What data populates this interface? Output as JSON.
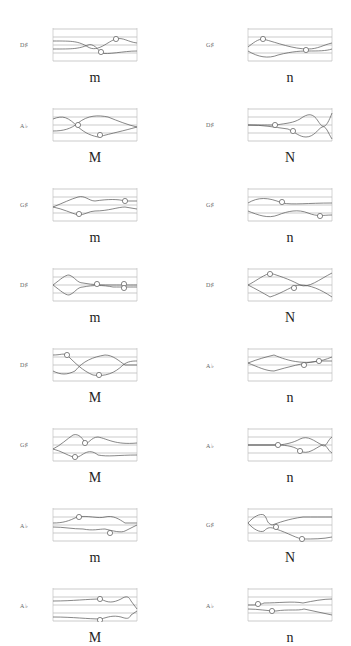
{
  "figure": {
    "columns": 2,
    "rows": 8,
    "panels": [
      {
        "id": "r1c1",
        "note": "D♯",
        "letter": "m",
        "col": 0,
        "row": 0
      },
      {
        "id": "r1c2",
        "note": "G♯",
        "letter": "n",
        "col": 1,
        "row": 0
      },
      {
        "id": "r2c1",
        "note": "A♭",
        "letter": "M",
        "col": 0,
        "row": 1
      },
      {
        "id": "r2c2",
        "note": "D♯",
        "letter": "N",
        "col": 1,
        "row": 1
      },
      {
        "id": "r3c1",
        "note": "G♯",
        "letter": "m",
        "col": 0,
        "row": 2
      },
      {
        "id": "r3c2",
        "note": "G♯",
        "letter": "n",
        "col": 1,
        "row": 2
      },
      {
        "id": "r4c1",
        "note": "D♯",
        "letter": "m",
        "col": 0,
        "row": 3
      },
      {
        "id": "r4c2",
        "note": "D♯",
        "letter": "N",
        "col": 1,
        "row": 3
      },
      {
        "id": "r5c1",
        "note": "D♯",
        "letter": "M",
        "col": 0,
        "row": 4
      },
      {
        "id": "r5c2",
        "note": "A♭",
        "letter": "n",
        "col": 1,
        "row": 4
      },
      {
        "id": "r6c1",
        "note": "G♯",
        "letter": "M",
        "col": 0,
        "row": 5
      },
      {
        "id": "r6c2",
        "note": "A♭",
        "letter": "n",
        "col": 1,
        "row": 5
      },
      {
        "id": "r7c1",
        "note": "A♭",
        "letter": "m",
        "col": 0,
        "row": 6
      },
      {
        "id": "r7c2",
        "note": "G♯",
        "letter": "N",
        "col": 1,
        "row": 6
      },
      {
        "id": "r8c1",
        "note": "A♭",
        "letter": "M",
        "col": 0,
        "row": 7
      },
      {
        "id": "r8c2",
        "note": "A♭",
        "letter": "n",
        "col": 1,
        "row": 7
      }
    ]
  },
  "traces": {
    "r1c1": {
      "paths": [
        "M0,12 C20,12 25,12 35,18 C45,24 55,12 63,10 C70,8 75,13 84,14",
        "M0,20 C20,20 25,20 35,16 C40,14 45,20 48,24 C55,26 70,22 84,22"
      ],
      "circles": [
        [
          63,
          10
        ],
        [
          48,
          23
        ]
      ]
    },
    "r1c2": {
      "paths": [
        "M0,18 C5,14 10,10 15,10 C30,14 45,20 60,20 C70,20 75,16 84,14",
        "M0,22 C10,28 20,30 30,26 C45,22 55,22 60,22 C70,22 78,22 84,20"
      ],
      "circles": [
        [
          15,
          10
        ],
        [
          58,
          21
        ]
      ]
    },
    "r2c1": {
      "paths": [
        "M0,10 C10,6 15,8 25,18 C30,22 35,26 45,28 C60,24 70,22 84,18",
        "M0,22 C10,22 18,20 25,14 C35,6 45,6 55,8 C65,12 75,16 84,18"
      ],
      "circles": [
        [
          25,
          16
        ],
        [
          47,
          26
        ]
      ]
    },
    "r2c2": {
      "paths": [
        "M0,16 C15,16 20,16 28,16 C40,14 45,14 52,10 C60,4 65,4 70,12 C75,20 78,20 84,4",
        "M0,16 C15,16 25,18 40,20 C48,24 52,28 58,28 C66,28 70,20 74,18 C78,16 80,24 84,30"
      ],
      "circles": [
        [
          27,
          16
        ],
        [
          45,
          22
        ]
      ]
    },
    "r3c1": {
      "paths": [
        "M0,18 C10,14 18,10 25,8 C32,6 36,12 42,12 C55,10 65,10 72,12 L84,12",
        "M0,18 C10,20 18,24 25,26 C32,26 36,22 42,22 C55,22 65,18 72,18 L84,20"
      ],
      "circles": [
        [
          72,
          12
        ],
        [
          26,
          25
        ]
      ]
    },
    "r3c2": {
      "paths": [
        "M0,14 C10,8 20,8 34,14 C45,16 60,14 84,14",
        "M0,22 C10,26 20,30 30,26 C40,22 50,20 60,24 C70,28 75,26 84,26"
      ],
      "circles": [
        [
          34,
          13
        ],
        [
          72,
          27
        ]
      ]
    },
    "r4c1": {
      "paths": [
        "M0,16 C8,10 12,6 16,6 C22,8 24,14 30,14 C40,16 50,16 60,16 C70,16 75,16 84,16",
        "M0,16 C8,22 12,26 16,26 C22,24 24,18 30,18 C40,16 50,16 60,18 C70,18 75,18 84,18"
      ],
      "circles": [
        [
          44,
          15
        ],
        [
          71,
          15
        ],
        [
          71,
          19
        ]
      ]
    },
    "r4c2": {
      "paths": [
        "M0,16 C8,12 12,8 22,4 C35,8 45,12 52,16 C60,20 72,10 84,4",
        "M0,16 C8,20 15,24 22,28 C35,24 45,16 52,16 C62,16 72,20 84,28"
      ],
      "circles": [
        [
          22,
          5
        ],
        [
          46,
          19
        ]
      ]
    },
    "r5c1": {
      "paths": [
        "M0,6 C8,6 10,4 14,6 C22,14 30,22 40,26 C52,28 62,24 70,16 C75,12 80,12 84,12",
        "M0,22 C8,26 14,26 22,22 C30,12 40,8 52,6 C60,6 66,12 72,16 L84,16"
      ],
      "circles": [
        [
          14,
          6
        ],
        [
          46,
          26
        ]
      ]
    },
    "r5c2": {
      "paths": [
        "M0,14 C10,10 18,8 26,6 C40,12 60,18 84,8",
        "M0,14 C10,18 18,22 26,22 C40,18 55,14 70,12 L84,12"
      ],
      "circles": [
        [
          56,
          16
        ],
        [
          71,
          12
        ]
      ]
    },
    "r6c1": {
      "paths": [
        "M0,20 C8,16 14,10 20,6 C26,4 30,10 32,14 C35,16 38,8 45,8 C55,10 62,16 84,14",
        "M0,20 C8,22 14,26 20,28 C24,30 28,26 32,24 C36,22 40,22 45,26 C55,28 65,26 84,26"
      ],
      "circles": [
        [
          32,
          14
        ],
        [
          22,
          28
        ]
      ]
    },
    "r6c2": {
      "paths": [
        "M0,16 L28,16 C35,16 45,14 52,10 C60,6 66,12 74,16 C78,20 80,10 84,8",
        "M0,16 L28,16 C40,16 48,18 52,22 C60,26 66,20 74,16 C78,14 80,22 84,24"
      ],
      "circles": [
        [
          30,
          16
        ],
        [
          52,
          22
        ]
      ]
    },
    "r7c1": {
      "paths": [
        "M0,14 C10,14 16,12 24,8 C35,6 45,10 52,8 C60,6 66,10 72,14 L84,14",
        "M0,18 C10,18 20,20 30,20 C40,22 46,20 52,20 C60,22 68,24 72,22 L84,16"
      ],
      "circles": [
        [
          26,
          8
        ],
        [
          57,
          24
        ]
      ]
    },
    "r7c2": {
      "paths": [
        "M0,14 C5,8 12,4 16,6 C20,10 18,14 24,16 C30,14 40,10 55,8 C65,8 75,8 84,8",
        "M0,14 C5,20 12,24 16,22 C20,18 22,18 28,20 C40,24 50,30 55,30 C65,30 75,30 84,28"
      ],
      "circles": [
        [
          28,
          18
        ],
        [
          54,
          30
        ]
      ]
    },
    "r8c1": {
      "paths": [
        "M0,12 C20,12 35,10 48,10 C55,14 60,14 68,10 C74,6 76,8 78,12 L84,20",
        "M0,28 C20,28 35,30 48,30 C55,28 60,26 68,28 C74,30 76,30 78,26 L84,22"
      ],
      "circles": [
        [
          47,
          10
        ],
        [
          47,
          31
        ]
      ]
    },
    "r8c2": {
      "paths": [
        "M0,16 C8,16 12,16 16,14 C30,14 45,12 55,14 C65,12 75,10 84,10",
        "M0,20 C10,20 20,22 28,22 C40,20 50,22 56,20 C65,22 75,24 84,26"
      ],
      "circles": [
        [
          10,
          15
        ],
        [
          24,
          22
        ]
      ]
    }
  }
}
